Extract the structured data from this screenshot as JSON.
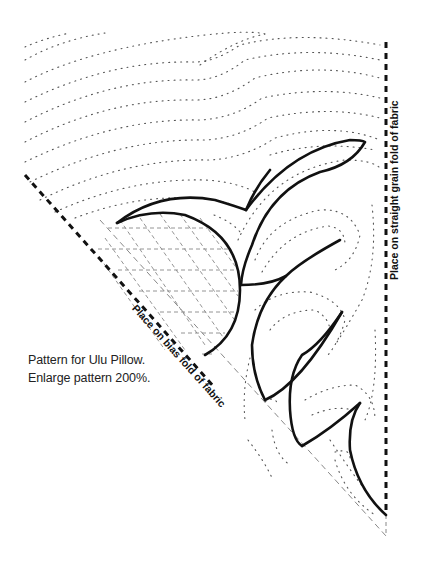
{
  "caption": {
    "line1": "Pattern for Ulu Pillow.",
    "line2": "Enlarge pattern 200%."
  },
  "labels": {
    "straight_grain": "Place on straight grain fold of fabric",
    "bias_fold": "Place on bias fold of fabric"
  },
  "colors": {
    "ink": "#111111",
    "quilting_dots": "#555555",
    "crosshatch": "#888888",
    "background": "#ffffff"
  }
}
